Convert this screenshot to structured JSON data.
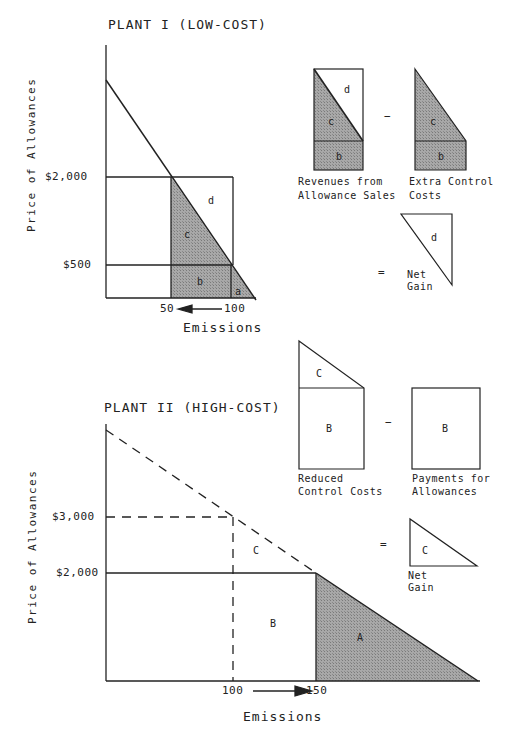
{
  "top_panel": {
    "title": "PLANT I (LOW-COST)",
    "y_axis_label": "Price of Allowances",
    "x_axis_label": "Emissions",
    "y_ticks": [
      "$2,000",
      "$500"
    ],
    "x_ticks": [
      "50",
      "100"
    ],
    "arrow_direction": "left",
    "regions": [
      "a",
      "b",
      "c",
      "d"
    ],
    "equation": {
      "term1": {
        "label": "Revenues from\nAllowance Sales",
        "line1": "Revenues from",
        "line2": "Allowance Sales",
        "regions": [
          "b",
          "c",
          "d"
        ]
      },
      "operator1": "−",
      "term2": {
        "line1": "Extra Control",
        "line2": "Costs",
        "regions": [
          "b",
          "c"
        ]
      },
      "operator2": "=",
      "result": {
        "line1": "Net",
        "line2": "Gain",
        "regions": [
          "d"
        ]
      }
    }
  },
  "bottom_panel": {
    "title": "PLANT II (HIGH-COST)",
    "y_axis_label": "Price of Allowances",
    "x_axis_label": "Emissions",
    "y_ticks": [
      "$3,000",
      "$2,000"
    ],
    "x_ticks": [
      "100",
      "150"
    ],
    "arrow_direction": "right",
    "regions": [
      "A",
      "B",
      "C"
    ],
    "equation": {
      "term1": {
        "line1": "Reduced",
        "line2": "Control Costs",
        "regions": [
          "B",
          "C"
        ]
      },
      "operator1": "−",
      "term2": {
        "line1": "Payments for",
        "line2": "Allowances",
        "regions": [
          "B"
        ]
      },
      "operator2": "=",
      "result": {
        "line1": "Net",
        "line2": "Gain",
        "regions": [
          "C"
        ]
      }
    }
  },
  "colors": {
    "shade": "#9a9a9a",
    "line": "#222222"
  }
}
